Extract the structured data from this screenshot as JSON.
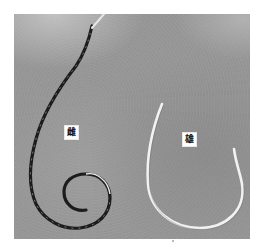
{
  "figure": {
    "type": "photograph",
    "labels": {
      "female": "雌",
      "male": "雄"
    },
    "colors": {
      "background_border": "#ffffff",
      "photo_gray": "#9a9a9a",
      "female_worm": "#1e1e1e",
      "male_worm": "#f0f0f0",
      "label_box": "#ffffff"
    }
  }
}
